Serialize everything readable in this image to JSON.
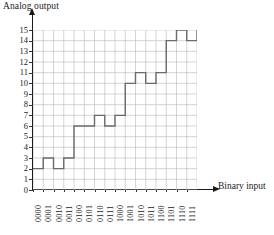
{
  "chart_data": {
    "type": "line",
    "title": "",
    "ylabel": "Analog output",
    "xlabel": "Binary input",
    "grid": true,
    "legend": "none",
    "ylim": [
      0,
      15
    ],
    "yticks": [
      0,
      1,
      2,
      3,
      4,
      5,
      6,
      7,
      8,
      9,
      10,
      11,
      12,
      13,
      14,
      15
    ],
    "categories": [
      "0000",
      "0001",
      "0010",
      "0011",
      "0100",
      "0101",
      "0110",
      "0111",
      "1000",
      "1001",
      "1010",
      "1011",
      "1100",
      "1101",
      "1110",
      "1111"
    ],
    "values": [
      2,
      3,
      2,
      3,
      6,
      6,
      7,
      6,
      7,
      10,
      11,
      10,
      11,
      14,
      15,
      14
    ],
    "step_style": "post",
    "final_value": 15,
    "series": [
      {
        "name": "Analog output",
        "values": [
          2,
          3,
          2,
          3,
          6,
          6,
          7,
          6,
          7,
          10,
          11,
          10,
          11,
          14,
          15,
          14
        ],
        "color": "#6b6b6b"
      }
    ]
  },
  "axis": {
    "y_title": "Analog output",
    "x_title": "Binary input",
    "y_tick_labels": [
      "15",
      "14",
      "13",
      "12",
      "11",
      "10",
      "9",
      "8",
      "7",
      "6",
      "5",
      "4",
      "3",
      "2",
      "1",
      "0"
    ],
    "x_tick_labels": [
      "0000",
      "0001",
      "0010",
      "0011",
      "0100",
      "0101",
      "0110",
      "0111",
      "1000",
      "1001",
      "1010",
      "1011",
      "1100",
      "1101",
      "1110",
      "1111"
    ]
  },
  "colors": {
    "axis": "#1a1a1a",
    "grid": "#b8b8b8",
    "trace": "#6b6b6b",
    "background": "#ffffff"
  }
}
